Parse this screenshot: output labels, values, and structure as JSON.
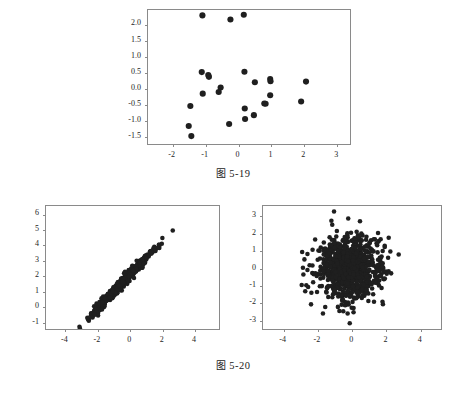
{
  "page": {
    "background": "#ffffff",
    "point_color": "#1f1f1f",
    "axis_color": "#8a8a8a"
  },
  "figures": [
    {
      "id": "fig-5-19",
      "caption_label": "图",
      "caption_number": "5-19"
    },
    {
      "id": "fig-5-20",
      "caption_label": "图",
      "caption_number": "5-20"
    }
  ],
  "chart_data": [
    {
      "type": "scatter",
      "title": "图 5-19",
      "xlabel": "",
      "ylabel": "",
      "xlim": [
        -2.75,
        3.45
      ],
      "ylim": [
        -1.78,
        2.45
      ],
      "xticks": [
        -2,
        -1,
        0,
        1,
        2,
        3
      ],
      "xticklabels": [
        "-2",
        "-1",
        "0",
        "1",
        "2",
        "3"
      ],
      "yticks": [
        -1.5,
        -1.0,
        -0.5,
        0.0,
        0.5,
        1.0,
        1.5,
        2.0
      ],
      "yticklabels": [
        "-1.5",
        "-1.0",
        "-0.5",
        "0.0",
        "0.5",
        "1.0",
        "1.5",
        "2.0"
      ],
      "grid": false,
      "legend": null,
      "marker_size": 3.1,
      "points": [
        [
          -1.08,
          2.28
        ],
        [
          -0.22,
          2.15
        ],
        [
          0.19,
          2.3
        ],
        [
          -1.1,
          0.49
        ],
        [
          -0.9,
          0.4
        ],
        [
          -0.88,
          0.34
        ],
        [
          0.21,
          0.5
        ],
        [
          0.53,
          0.17
        ],
        [
          1.0,
          0.27
        ],
        [
          1.01,
          0.2
        ],
        [
          2.1,
          0.19
        ],
        [
          -0.52,
          0.0
        ],
        [
          -0.58,
          -0.14
        ],
        [
          -1.07,
          -0.19
        ],
        [
          -1.45,
          -0.58
        ],
        [
          0.22,
          -0.66
        ],
        [
          0.82,
          -0.5
        ],
        [
          0.86,
          -0.51
        ],
        [
          1.0,
          -0.24
        ],
        [
          1.95,
          -0.44
        ],
        [
          0.5,
          -0.87
        ],
        [
          0.23,
          -0.99
        ],
        [
          -0.26,
          -1.15
        ],
        [
          -1.5,
          -1.21
        ],
        [
          -1.42,
          -1.53
        ]
      ]
    },
    {
      "type": "scatter",
      "title": "图 5-20 (left)",
      "subtitle": "strong positive linear correlation",
      "xlabel": "",
      "ylabel": "",
      "xlim": [
        -5.2,
        5.6
      ],
      "ylim": [
        -1.55,
        6.55
      ],
      "xticks": [
        -4,
        -2,
        0,
        2,
        4
      ],
      "xticklabels": [
        "-4",
        "-2",
        "0",
        "2",
        "4"
      ],
      "yticks": [
        -1,
        0,
        1,
        2,
        3,
        4,
        5,
        6
      ],
      "yticklabels": [
        "-1",
        "0",
        "1",
        "2",
        "3",
        "4",
        "5",
        "6"
      ],
      "grid": false,
      "legend": null,
      "marker_size": 2.3,
      "n_points": 600,
      "distribution": "bivariate-normal-correlated",
      "x_mean": -0.45,
      "x_std": 1.0,
      "y_intercept": 2.0,
      "y_slope": 1.12,
      "noise_std": 0.16,
      "seed": 17
    },
    {
      "type": "scatter",
      "title": "图 5-20 (right)",
      "subtitle": "no correlation",
      "xlabel": "",
      "ylabel": "",
      "xlim": [
        -5.2,
        5.3
      ],
      "ylim": [
        -3.6,
        3.6
      ],
      "xticks": [
        -4,
        -2,
        0,
        2,
        4
      ],
      "xticklabels": [
        "-4",
        "-2",
        "0",
        "2",
        "4"
      ],
      "yticks": [
        -3,
        -2,
        -1,
        0,
        1,
        2,
        3
      ],
      "yticklabels": [
        "-3",
        "-2",
        "-1",
        "0",
        "1",
        "2",
        "3"
      ],
      "grid": false,
      "legend": null,
      "marker_size": 2.3,
      "n_points": 900,
      "distribution": "bivariate-normal-uncorrelated",
      "x_mean": -0.1,
      "x_std": 0.92,
      "y_mean": 0.0,
      "y_std": 0.95,
      "seed": 42
    }
  ]
}
